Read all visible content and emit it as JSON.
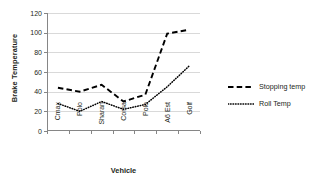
{
  "chart_data": {
    "type": "line",
    "title": "",
    "xlabel": "Vehicle",
    "ylabel": "Brake Temperature",
    "categories": [
      "Cmax",
      "Polo",
      "Sharan",
      "Corsa",
      "Polo",
      "A6 Est",
      "Golf"
    ],
    "series": [
      {
        "name": "Stopping temp",
        "style": "dashed",
        "color": "#000000",
        "values": [
          44,
          40,
          47,
          30,
          37,
          99,
          103
        ]
      },
      {
        "name": "Roll Temp",
        "style": "dotted",
        "color": "#000000",
        "values": [
          28,
          20,
          30,
          22,
          27,
          45,
          66
        ]
      }
    ],
    "ylim": [
      0,
      120
    ],
    "ytick_values": [
      0,
      20,
      40,
      60,
      80,
      100,
      120
    ],
    "ytick_labels": [
      "0",
      "20",
      "40",
      "60",
      "80",
      "100",
      "120"
    ],
    "grid": "horizontal",
    "legend_position": "right",
    "legend_entries": [
      "Stopping temp",
      "Roll Temp"
    ]
  }
}
